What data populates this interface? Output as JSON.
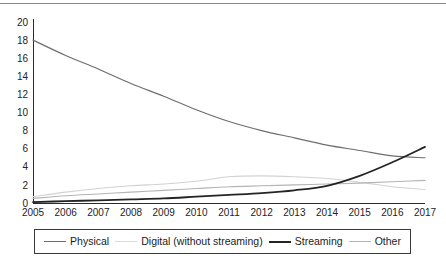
{
  "chart_data": {
    "type": "line",
    "title": "",
    "subtitle": "",
    "xlabel": "",
    "ylabel": "",
    "x": [
      "2005",
      "2006",
      "2007",
      "2008",
      "2009",
      "2010",
      "2011",
      "2012",
      "2013",
      "2014",
      "2015",
      "2016",
      "2017"
    ],
    "categories": [
      "2005",
      "2006",
      "2007",
      "2008",
      "2009",
      "2010",
      "2011",
      "2012",
      "2013",
      "2014",
      "2015",
      "2016",
      "2017"
    ],
    "xlim": [
      "2005",
      "2017"
    ],
    "ylim": [
      0,
      20
    ],
    "yticks": [
      0,
      2,
      4,
      6,
      8,
      10,
      12,
      14,
      16,
      18,
      20
    ],
    "ytick_labels": [
      "0",
      "2",
      "4",
      "6",
      "8",
      "10",
      "12",
      "14",
      "16",
      "18",
      "20"
    ],
    "xtick_labels": [
      "2005",
      "2006",
      "2007",
      "2008",
      "2009",
      "2010",
      "2011",
      "2012",
      "2013",
      "2014",
      "2015",
      "2016",
      "2017"
    ],
    "grid": false,
    "legend_position": "bottom",
    "series": [
      {
        "name": "Physical",
        "color": "#6e6e6e",
        "width": 1.2,
        "values": [
          18.0,
          16.3,
          14.8,
          13.2,
          11.8,
          10.3,
          9.0,
          8.0,
          7.2,
          6.4,
          5.8,
          5.2,
          5.0
        ]
      },
      {
        "name": "Digital (without streaming)",
        "color": "#d2d2d2",
        "width": 1.1,
        "values": [
          0.7,
          1.2,
          1.6,
          1.9,
          2.1,
          2.4,
          2.9,
          3.0,
          2.9,
          2.7,
          2.3,
          1.8,
          1.5
        ]
      },
      {
        "name": "Streaming",
        "color": "#242424",
        "width": 1.8,
        "values": [
          0.1,
          0.2,
          0.3,
          0.4,
          0.5,
          0.7,
          0.9,
          1.1,
          1.4,
          1.9,
          3.0,
          4.5,
          6.2
        ]
      },
      {
        "name": "Other",
        "color": "#b4b4b4",
        "width": 1.1,
        "values": [
          0.5,
          0.8,
          1.0,
          1.2,
          1.4,
          1.6,
          1.8,
          1.9,
          2.0,
          2.1,
          2.2,
          2.35,
          2.5
        ]
      }
    ]
  },
  "legend": {
    "items": [
      {
        "label": "Physical",
        "color": "#6e6e6e",
        "width": "1.3px"
      },
      {
        "label": "Digital (without streaming)",
        "color": "#dadada",
        "width": "1.1px"
      },
      {
        "label": "Streaming",
        "color": "#242424",
        "width": "2px"
      },
      {
        "label": "Other",
        "color": "#b4b4b4",
        "width": "1.1px"
      }
    ]
  },
  "colors": {
    "physical": "#6e6e6e",
    "digital": "#d2d2d2",
    "streaming": "#242424",
    "other": "#b4b4b4",
    "axis": "#2b2b2b",
    "text": "#1c1c1c",
    "background": "#ffffff"
  }
}
